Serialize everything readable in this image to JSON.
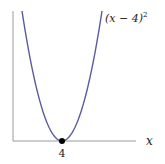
{
  "chart_data": {
    "type": "line",
    "title": "",
    "xlabel": "x",
    "ylabel": "",
    "series": [
      {
        "name": "(x − 4)²",
        "function": "(x-4)^2",
        "color": "#5b5b9e"
      }
    ],
    "annotations": [
      {
        "type": "point",
        "x": 4,
        "y": 0,
        "label": "4",
        "color": "#000000"
      }
    ],
    "x_ticks": [
      "4"
    ],
    "grid": false,
    "legend": "inline label at top right of curve"
  },
  "labels": {
    "curve": "(x − 4)",
    "curve_exp": "2",
    "x_axis": "x",
    "vertex_tick": "4"
  },
  "colors": {
    "curve": "#5b5b9e",
    "axis": "#9a9a9a",
    "point": "#000000"
  }
}
